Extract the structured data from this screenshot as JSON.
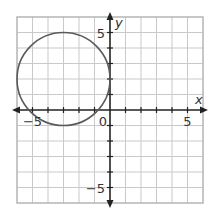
{
  "chart_data": {
    "type": "line",
    "title": "",
    "xlabel": "x",
    "ylabel": "y",
    "xlim": [
      -6,
      6
    ],
    "ylim": [
      -6,
      6
    ],
    "grid": true,
    "grid_step": 1,
    "x_tick_labels": [
      {
        "value": -5,
        "text": "−5"
      },
      {
        "value": 0,
        "text": "0"
      },
      {
        "value": 5,
        "text": "5"
      }
    ],
    "y_tick_labels": [
      {
        "value": 5,
        "text": "5"
      },
      {
        "value": -5,
        "text": "−5"
      }
    ],
    "series": [
      {
        "name": "circle",
        "shape": "circle",
        "center": [
          -3,
          2
        ],
        "radius": 3,
        "color": "#5a5a5a"
      }
    ],
    "colors": {
      "grid": "#c9c9c9",
      "border": "#b5b5b5",
      "axis": "#222222"
    }
  }
}
